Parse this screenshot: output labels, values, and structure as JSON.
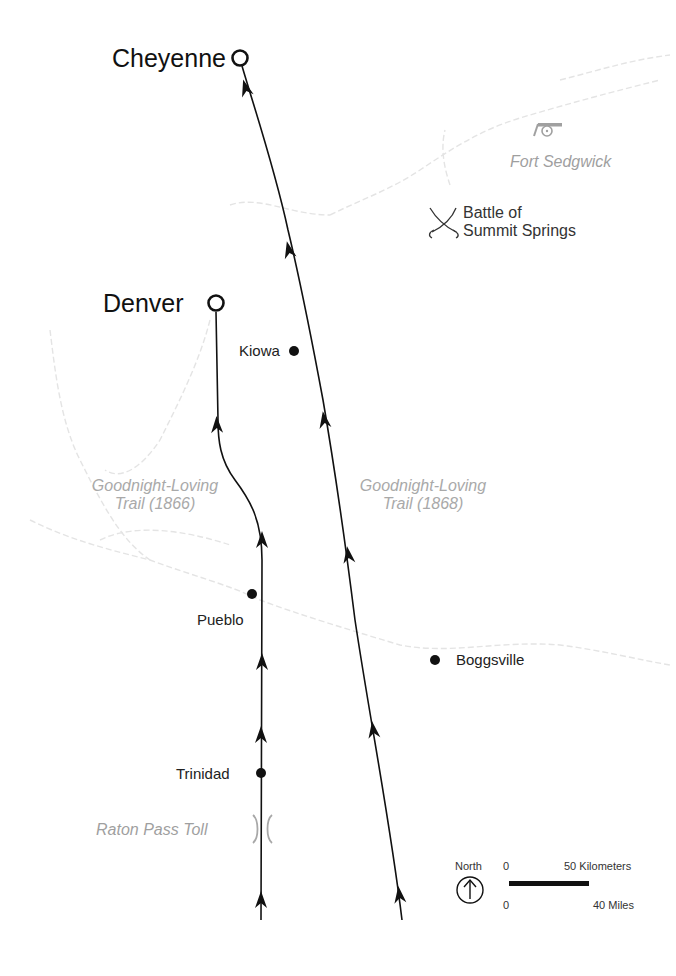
{
  "map": {
    "colors": {
      "trail": "#111111",
      "background_lines": "#e6e6e6",
      "trail_label": "#a9a9a9",
      "fort_icon": "#a0a0a0"
    },
    "major_cities": [
      {
        "name": "Cheyenne",
        "x": 240,
        "y": 58
      },
      {
        "name": "Denver",
        "x": 216,
        "y": 303
      }
    ],
    "towns": [
      {
        "name": "Kiowa",
        "x": 294,
        "y": 351
      },
      {
        "name": "Pueblo",
        "x": 252,
        "y": 594
      },
      {
        "name": "Boggsville",
        "x": 435,
        "y": 660
      },
      {
        "name": "Trinidad",
        "x": 261,
        "y": 773
      }
    ],
    "trails": [
      {
        "name": "Goodnight-Loving Trail (1866)",
        "line1": "Goodnight-Loving",
        "line2": "Trail (1866)"
      },
      {
        "name": "Goodnight-Loving Trail (1868)",
        "line1": "Goodnight-Loving",
        "line2": "Trail (1868)"
      }
    ],
    "points_of_interest": {
      "fort": {
        "name": "Fort Sedgwick",
        "icon": "cannon-icon"
      },
      "battle": {
        "line1": "Battle of",
        "line2": "Summit Springs",
        "icon": "crossed-sabers-icon"
      },
      "toll": {
        "name": "Raton Pass Toll",
        "icon": "mountain-pass-icon"
      }
    },
    "legend": {
      "north_label": "North",
      "north_icon": "north-arrow-icon",
      "scale_km_start": "0",
      "scale_km_end": "50 Kilometers",
      "scale_mi_start": "0",
      "scale_mi_end": "40 Miles"
    }
  }
}
